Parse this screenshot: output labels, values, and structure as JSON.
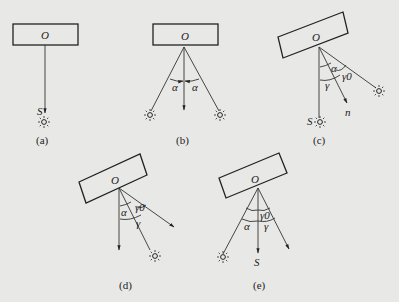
{
  "diagram": {
    "background": "#e8e8e6",
    "panels": [
      {
        "id": "a",
        "caption": "(a)",
        "center_label": "O",
        "source_label": "S"
      },
      {
        "id": "b",
        "caption": "(b)",
        "center_label": "O",
        "angle_left": "α",
        "angle_right": "α"
      },
      {
        "id": "c",
        "caption": "(c)",
        "center_label": "O",
        "source_label": "S",
        "angle_alpha": "α",
        "angle_gamma0": "γ0",
        "angle_gamma": "γ",
        "normal_label": "n"
      },
      {
        "id": "d",
        "caption": "(d)",
        "center_label": "O",
        "angle_alpha": "α",
        "angle_gamma0": "γ0",
        "angle_gamma": "γ"
      },
      {
        "id": "e",
        "caption": "(e)",
        "center_label": "O",
        "source_label": "S",
        "angle_alpha": "α",
        "angle_gamma0": "γ0",
        "angle_gamma": "γ"
      }
    ]
  }
}
